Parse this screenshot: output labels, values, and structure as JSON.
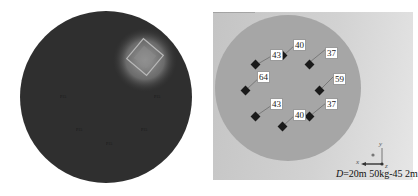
{
  "left_panel": {
    "title": "charge hole layout (top view, rendered)",
    "spot_labels": [
      "P15",
      "P15",
      "P15",
      "P15",
      "P15"
    ],
    "colors": {
      "disc": "#2e2e2e",
      "highlight": "#8f8f8f"
    }
  },
  "right_panel": {
    "point_labels": [
      "40",
      "43",
      "37",
      "64",
      "59",
      "43",
      "37",
      "40"
    ],
    "axes": {
      "x": "x",
      "y": "y",
      "z": "z"
    },
    "caption": {
      "d_symbol": "D",
      "d_value": "=20m 50kg-45 2m"
    },
    "colors": {
      "disc": "#a5a5a5",
      "marker": "#1a1a1a"
    }
  }
}
